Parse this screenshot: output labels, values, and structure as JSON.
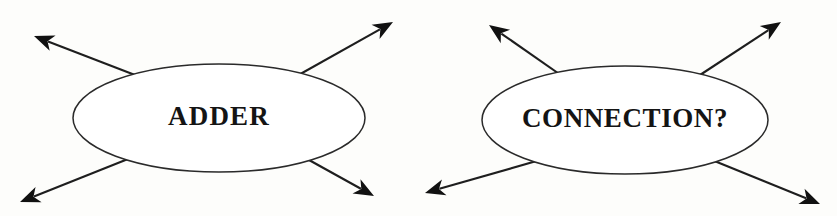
{
  "figure": {
    "background_color": "#fdfdfb",
    "stroke_color": "#1e1e1e",
    "text_color": "#141414",
    "width": 837,
    "height": 216
  },
  "nodes": [
    {
      "id": "adder",
      "label": "ADDER",
      "cx": 219,
      "cy": 118,
      "rx": 146,
      "ry": 54,
      "font_size": 27,
      "letter_spacing": 1.2
    },
    {
      "id": "connection",
      "label": "CONNECTION?",
      "cx": 625,
      "cy": 120,
      "rx": 143,
      "ry": 54,
      "font_size": 27,
      "letter_spacing": 0.6
    }
  ],
  "arrows": [
    {
      "id": "adder-arrow-top-left",
      "node": "adder",
      "direction": "up-left",
      "x1": 148,
      "y1": 80,
      "x2": 34,
      "y2": 36
    },
    {
      "id": "adder-arrow-top-right",
      "node": "adder",
      "direction": "up-right",
      "x1": 295,
      "y1": 77,
      "x2": 393,
      "y2": 22
    },
    {
      "id": "adder-arrow-bottom-left",
      "node": "adder",
      "direction": "down-left",
      "x1": 133,
      "y1": 157,
      "x2": 20,
      "y2": 202
    },
    {
      "id": "adder-arrow-bottom-right",
      "node": "adder",
      "direction": "down-right",
      "x1": 300,
      "y1": 155,
      "x2": 374,
      "y2": 196
    },
    {
      "id": "connection-arrow-top-left",
      "node": "connection",
      "direction": "up-left",
      "x1": 565,
      "y1": 78,
      "x2": 489,
      "y2": 25
    },
    {
      "id": "connection-arrow-top-right",
      "node": "connection",
      "direction": "up-right",
      "x1": 700,
      "y1": 75,
      "x2": 781,
      "y2": 22
    },
    {
      "id": "connection-arrow-bottom-left",
      "node": "connection",
      "direction": "down-left",
      "x1": 540,
      "y1": 160,
      "x2": 425,
      "y2": 193
    },
    {
      "id": "connection-arrow-bottom-right",
      "node": "connection",
      "direction": "down-right",
      "x1": 712,
      "y1": 160,
      "x2": 820,
      "y2": 204
    }
  ]
}
